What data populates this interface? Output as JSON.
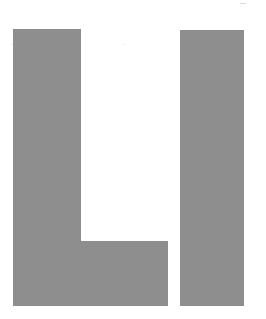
{
  "image": {
    "description": "Block letters L and I in flat gray on white",
    "letters": [
      "L",
      "I"
    ],
    "colors": {
      "background": "#ffffff",
      "fill": "#8e8e8e"
    },
    "shapes": {
      "l_stem": {
        "x": 13,
        "y": 29,
        "w": 68,
        "h": 277
      },
      "l_foot": {
        "x": 81,
        "y": 241,
        "w": 87,
        "h": 65
      },
      "i_bar": {
        "x": 180,
        "y": 30,
        "w": 64,
        "h": 276
      }
    }
  }
}
